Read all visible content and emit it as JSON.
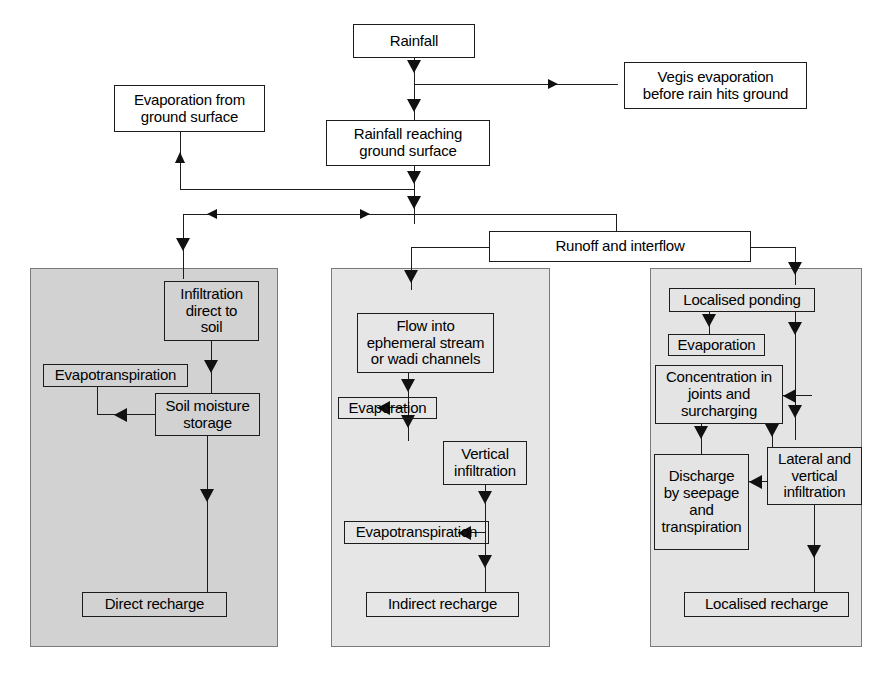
{
  "diagram": {
    "colors": {
      "line": "#1c1c1c",
      "panel_left_fill": "#d2d2d2",
      "panel_mid_fill": "#e6e6e6",
      "panel_right_fill": "#e4e4e4",
      "box_fill": "#ffffff",
      "background": "#ffffff"
    },
    "nodes": {
      "rainfall": "Rainfall",
      "vegis_evaporation": "Vegis evaporation\nbefore rain hits ground",
      "evaporation_ground_surface": "Evaporation from\nground surface",
      "rainfall_reaching_ground": "Rainfall reaching\nground surface",
      "runoff_interflow": "Runoff and interflow",
      "infiltration_direct_soil": "Infiltration\ndirect  to\nsoil",
      "evapotranspiration_left": "Evapotranspiration",
      "soil_moisture_storage": "Soil moisture\nstorage",
      "direct_recharge": "Direct recharge",
      "flow_into_ephemeral": "Flow into\nephemeral stream\nor wadi channels",
      "evaporation_mid": "Evaporation",
      "vertical_infiltration": "Vertical\ninfiltration",
      "evapotranspiration_mid": "Evapotranspiration",
      "indirect_recharge": "Indirect recharge",
      "localised_ponding": "Localised ponding",
      "evaporation_right": "Evaporation",
      "concentration_joints": "Concentration in\njoints and\nsurcharging",
      "lateral_vertical_infiltration": "Lateral and\nvertical\ninfiltration",
      "discharge_seepage": "Discharge\nby seepage\nand\ntranspiration",
      "localised_recharge": "Localised recharge"
    },
    "panels": {
      "left": "direct recharge pathway",
      "middle": "indirect recharge pathway",
      "right": "localised recharge pathway"
    }
  }
}
